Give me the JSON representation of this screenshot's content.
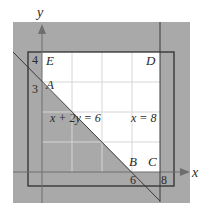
{
  "diagram": {
    "type": "feasible-region-graph",
    "axes": {
      "x_label": "x",
      "y_label": "y"
    },
    "ticks": {
      "x": [
        "6",
        "8"
      ],
      "y": [
        "3",
        "4"
      ]
    },
    "points": {
      "A": "A",
      "B": "B",
      "C": "C",
      "D": "D",
      "E": "E"
    },
    "line_labels": {
      "diagonal": "x + 2y = 6",
      "vertical": "x = 8"
    },
    "colors": {
      "shade": "#a9a9a9",
      "feasible": "#ffffff",
      "grid": "#d6d6d6",
      "line": "#3a3a3a",
      "axis": "#6e6e6e"
    }
  }
}
